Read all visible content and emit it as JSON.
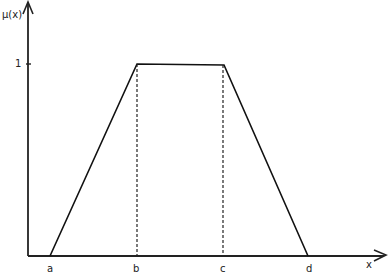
{
  "diagram": {
    "y_axis_label": "μ(x)",
    "x_axis_label": "x",
    "y_tick_label": "1",
    "points": [
      {
        "name": "a",
        "label": "a"
      },
      {
        "name": "b",
        "label": "b"
      },
      {
        "name": "c",
        "label": "c"
      },
      {
        "name": "d",
        "label": "d"
      }
    ],
    "colors": {
      "line": "#111111",
      "background": "#ffffff"
    }
  }
}
